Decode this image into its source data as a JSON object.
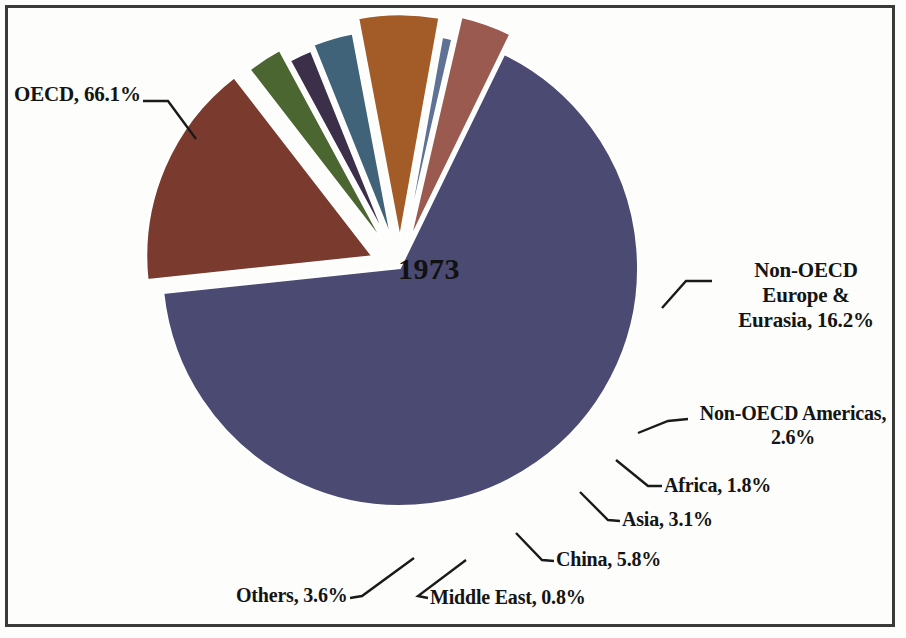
{
  "figure": {
    "center_year": "1973",
    "frame_color": "#3a3a3a",
    "background_color": "#fdfdfb"
  },
  "labels": {
    "oecd": "OECD, 66.1%",
    "non_oecd_europe_eurasia": "Non-OECD\nEurope &\nEurasia, 16.2%",
    "non_oecd_americas": "Non-OECD Americas,\n2.6%",
    "africa": "Africa, 1.8%",
    "asia": "Asia, 3.1%",
    "china": "China, 5.8%",
    "middle_east": "Middle East, 0.8%",
    "others": "Others, 3.6%"
  },
  "chart_data": {
    "type": "pie",
    "title": "1973",
    "xlabel": "",
    "ylabel": "",
    "legend_position": "none",
    "grid": false,
    "exploded": true,
    "labels_format": "name, percent",
    "categories": [
      "OECD",
      "Non-OECD Europe & Eurasia",
      "Non-OECD Americas",
      "Africa",
      "Asia",
      "China",
      "Middle East",
      "Others"
    ],
    "values": [
      66.1,
      16.2,
      2.6,
      1.8,
      3.1,
      5.8,
      0.8,
      3.6
    ],
    "units": "percent",
    "total": 100.0,
    "colors": [
      "#4a4a72",
      "#7a3b2e",
      "#4b6630",
      "#3b2f4a",
      "#40637a",
      "#a35c28",
      "#5f7296",
      "#9a5a50"
    ],
    "series": [
      {
        "name": "Share of total primary energy supply, 1973",
        "values": [
          66.1,
          16.2,
          2.6,
          1.8,
          3.1,
          5.8,
          0.8,
          3.6
        ]
      }
    ],
    "slices": [
      {
        "name": "OECD",
        "value": 66.1,
        "color": "#4a4a72",
        "label": "OECD, 66.1%"
      },
      {
        "name": "Non-OECD Europe & Eurasia",
        "value": 16.2,
        "color": "#7a3b2e",
        "label": "Non-OECD Europe & Eurasia, 16.2%"
      },
      {
        "name": "Non-OECD Americas",
        "value": 2.6,
        "color": "#4b6630",
        "label": "Non-OECD Americas, 2.6%"
      },
      {
        "name": "Africa",
        "value": 1.8,
        "color": "#3b2f4a",
        "label": "Africa, 1.8%"
      },
      {
        "name": "Asia",
        "value": 3.1,
        "color": "#40637a",
        "label": "Asia, 3.1%"
      },
      {
        "name": "China",
        "value": 5.8,
        "color": "#a35c28",
        "label": "China, 5.8%"
      },
      {
        "name": "Middle East",
        "value": 0.8,
        "color": "#5f7296",
        "label": "Middle East, 0.8%"
      },
      {
        "name": "Others",
        "value": 3.6,
        "color": "#9a5a50",
        "label": "Others, 3.6%"
      }
    ]
  }
}
